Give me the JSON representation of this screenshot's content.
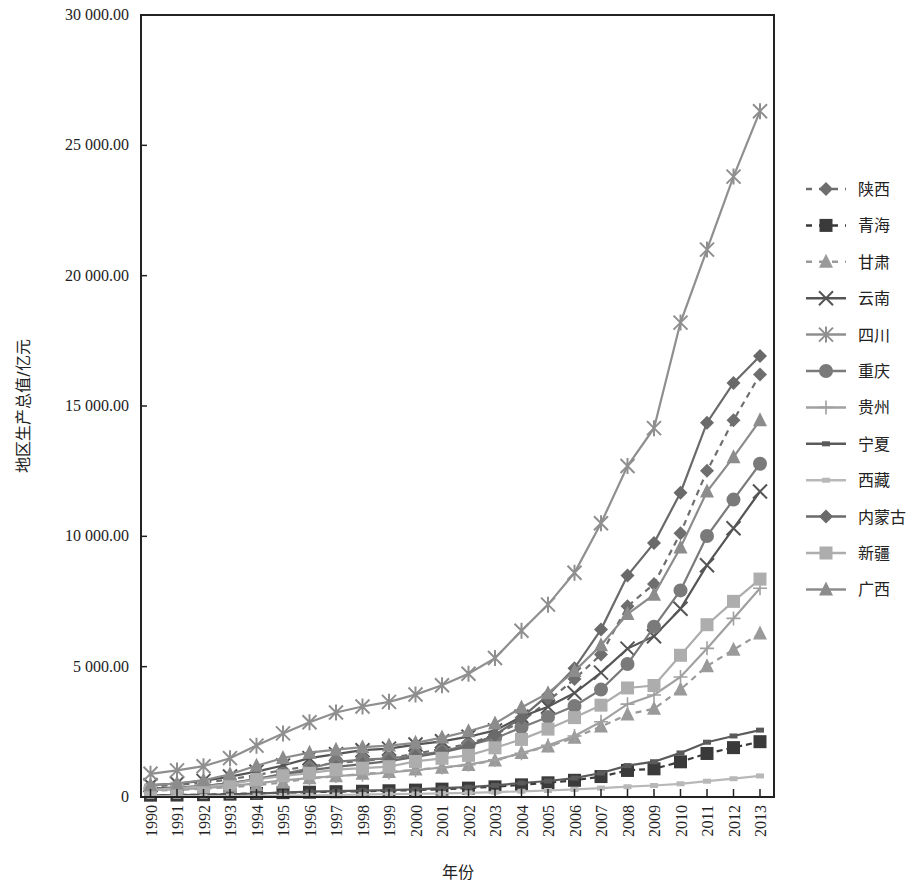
{
  "chart_data": {
    "type": "line",
    "title": "",
    "xlabel": "年份",
    "ylabel": "地区生产总值/亿元",
    "ylim": [
      0,
      30000
    ],
    "yticks": [
      0,
      5000,
      10000,
      15000,
      20000,
      25000,
      30000
    ],
    "ytick_labels": [
      "0",
      "5 000.00",
      "10 000.00",
      "15 000.00",
      "20 000.00",
      "25 000.00",
      "30 000.00"
    ],
    "grid": false,
    "legend_position": "right",
    "categories": [
      "1990",
      "1991",
      "1992",
      "1993",
      "1994",
      "1995",
      "1996",
      "1997",
      "1998",
      "1999",
      "2000",
      "2001",
      "2002",
      "2003",
      "2004",
      "2005",
      "2006",
      "2007",
      "2008",
      "2009",
      "2010",
      "2011",
      "2012",
      "2013"
    ],
    "series": [
      {
        "name": "陕西",
        "color": "#6e6e6e",
        "dash": "6,5",
        "marker": "diamond",
        "values": [
          404,
          468,
          538,
          678,
          839,
          1036,
          1175,
          1300,
          1382,
          1488,
          1661,
          1845,
          2036,
          2399,
          2884,
          3676,
          4523,
          5466,
          7315,
          8170,
          10123,
          12512,
          14454,
          16205
        ]
      },
      {
        "name": "青海",
        "color": "#3a3a3a",
        "dash": "6,4",
        "marker": "square",
        "values": [
          70,
          75,
          88,
          110,
          138,
          167,
          184,
          203,
          221,
          239,
          264,
          301,
          341,
          390,
          466,
          544,
          641,
          784,
          1019,
          1081,
          1350,
          1670,
          1894,
          2122
        ]
      },
      {
        "name": "甘肃",
        "color": "#9a9a9a",
        "dash": "6,5",
        "marker": "triangle",
        "values": [
          242,
          271,
          317,
          372,
          451,
          558,
          723,
          794,
          888,
          956,
          1052,
          1125,
          1232,
          1399,
          1688,
          1934,
          2277,
          2702,
          3167,
          3388,
          4121,
          5020,
          5650,
          6268
        ]
      },
      {
        "name": "云南",
        "color": "#555555",
        "dash": "",
        "marker": "x",
        "values": [
          452,
          518,
          618,
          784,
          974,
          1207,
          1492,
          1644,
          1794,
          1856,
          2011,
          2138,
          2313,
          2556,
          3082,
          3462,
          3988,
          4773,
          5692,
          6170,
          7224,
          8893,
          10309,
          11721
        ]
      },
      {
        "name": "四川",
        "color": "#8f8f8f",
        "dash": "",
        "marker": "asterisk",
        "values": [
          890,
          1020,
          1180,
          1490,
          1970,
          2440,
          2870,
          3240,
          3470,
          3650,
          3930,
          4290,
          4730,
          5330,
          6380,
          7380,
          8600,
          10500,
          12700,
          14150,
          18200,
          21000,
          23800,
          26310
        ]
      },
      {
        "name": "重庆",
        "color": "#7a7a7a",
        "dash": "",
        "marker": "circle",
        "values": [
          328,
          365,
          420,
          520,
          685,
          886,
          1090,
          1350,
          1430,
          1480,
          1590,
          1750,
          1990,
          2250,
          2670,
          3070,
          3490,
          4120,
          5100,
          6530,
          7926,
          10011,
          11410,
          12783
        ]
      },
      {
        "name": "贵州",
        "color": "#a0a0a0",
        "dash": "",
        "marker": "plus",
        "values": [
          260,
          296,
          340,
          417,
          522,
          636,
          723,
          806,
          858,
          938,
          1030,
          1133,
          1243,
          1427,
          1678,
          1979,
          2339,
          2884,
          3562,
          3913,
          4602,
          5702,
          6852,
          8007
        ]
      },
      {
        "name": "宁夏",
        "color": "#5a5a5a",
        "dash": "",
        "marker": "bar",
        "values": [
          65,
          72,
          83,
          104,
          134,
          170,
          202,
          225,
          245,
          265,
          295,
          337,
          377,
          445,
          537,
          612,
          726,
          919,
          1204,
          1353,
          1690,
          2102,
          2341,
          2565
        ]
      },
      {
        "name": "西藏",
        "color": "#b8b8b8",
        "dash": "",
        "marker": "bar",
        "values": [
          28,
          30,
          33,
          37,
          46,
          56,
          64,
          77,
          92,
          106,
          118,
          139,
          162,
          185,
          220,
          249,
          291,
          342,
          394,
          441,
          507,
          606,
          701,
          808
        ]
      },
      {
        "name": "内蒙古",
        "color": "#6a6a6a",
        "dash": "",
        "marker": "diamond",
        "values": [
          319,
          359,
          422,
          537,
          682,
          857,
          1023,
          1153,
          1262,
          1379,
          1540,
          1714,
          1941,
          2388,
          3041,
          3905,
          4944,
          6423,
          8496,
          9740,
          11672,
          14360,
          15881,
          16916
        ]
      },
      {
        "name": "新疆",
        "color": "#adadad",
        "dash": "",
        "marker": "square",
        "values": [
          261,
          336,
          402,
          495,
          673,
          815,
          912,
          1050,
          1107,
          1163,
          1364,
          1485,
          1598,
          1886,
          2209,
          2604,
          3045,
          3523,
          4183,
          4277,
          5437,
          6610,
          7505,
          8360
        ]
      },
      {
        "name": "广西",
        "color": "#8c8c8c",
        "dash": "",
        "marker": "triangle",
        "values": [
          449,
          518,
          646,
          871,
          1198,
          1498,
          1698,
          1817,
          1911,
          1971,
          2080,
          2279,
          2524,
          2821,
          3433,
          3984,
          4829,
          5823,
          7021,
          7759,
          9570,
          11721,
          13035,
          14450
        ]
      }
    ]
  }
}
